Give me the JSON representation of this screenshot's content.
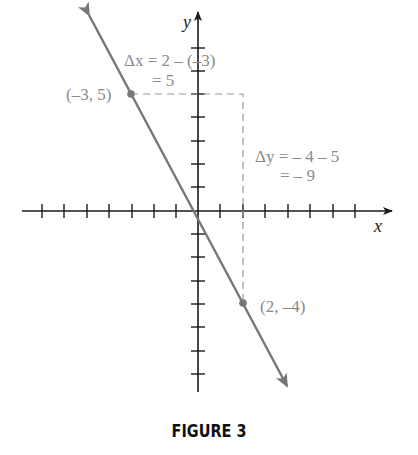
{
  "figure": {
    "caption": "FIGURE 3",
    "axes": {
      "x_label": "x",
      "y_label": "y"
    },
    "points": [
      {
        "label": "(–3, 5)",
        "x": -3,
        "y": 5
      },
      {
        "label": "(2, –4)",
        "x": 2,
        "y": -4
      }
    ],
    "annotations": {
      "dx_line1": "Δx = 2 – (–3)",
      "dx_line2": "= 5",
      "dy_line1": "Δy = – 4 – 5",
      "dy_line2": "= – 9"
    },
    "colors": {
      "line": "#777777",
      "axis": "#1a1a1a",
      "text": "#8a8a8a",
      "dashed": "#9a9a9a"
    }
  }
}
